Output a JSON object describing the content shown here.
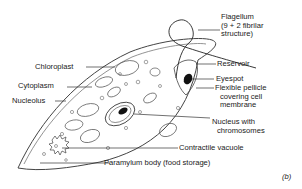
{
  "diagram": {
    "figure_label": "(b)",
    "labels": {
      "flagellum": [
        "Flagellum",
        "(9 + 2 fibrilar",
        "structure)"
      ],
      "reservoir": "Reservoir",
      "eyespot": "Eyespot",
      "pellicle": [
        "Flexible pellicle",
        "covering cell",
        "membrane"
      ],
      "nucleus": [
        "Nucleus with",
        "chromosomes"
      ],
      "contractile_vacuole": "Contractile vacuole",
      "paramylum": "Paramylum body (food storage)",
      "chloroplast": "Chloroplast",
      "cytoplasm": "Cytoplasm",
      "nucleolus": "Nucleolus"
    }
  }
}
